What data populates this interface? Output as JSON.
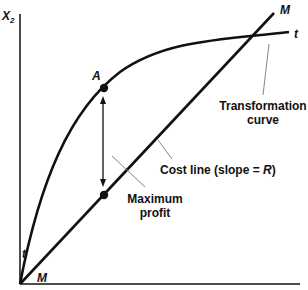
{
  "diagram": {
    "axes": {
      "y_label": "X",
      "y_label_subscript": "2"
    },
    "curves": {
      "cost_line": {
        "label_start": "M",
        "label_end": "M"
      },
      "transformation_curve": {
        "label_start": "t",
        "label_end": "t"
      }
    },
    "points": {
      "a_label": "A"
    },
    "annotations": {
      "transformation_line1": "Transformation",
      "transformation_line2": "curve",
      "cost_line_text": "Cost line (slope = ",
      "cost_line_slope": "R",
      "cost_line_close": ")",
      "max_profit_line1": "Maximum",
      "max_profit_line2": "profit"
    },
    "colors": {
      "line": "#111111",
      "leader": "#777777",
      "background": "#ffffff"
    }
  }
}
